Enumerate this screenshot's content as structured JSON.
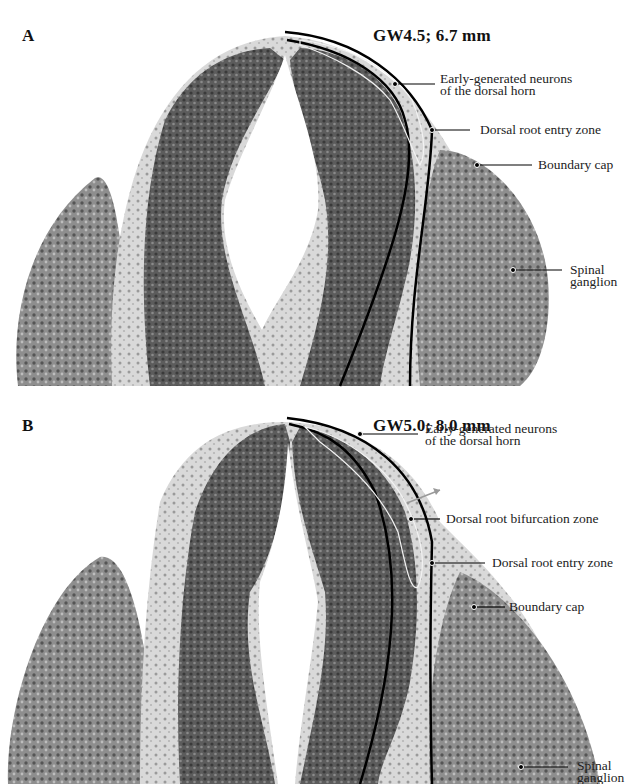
{
  "figure": {
    "panels": [
      {
        "letter": "A",
        "title": "GW4.5; 6.7 mm",
        "labels": {
          "early_neurons_line1": "Early-generated neurons",
          "early_neurons_line2": "of the dorsal horn",
          "entry_zone": "Dorsal root entry zone",
          "boundary_cap": "Boundary cap",
          "ganglion_line1": "Spinal",
          "ganglion_line2": "ganglion"
        }
      },
      {
        "letter": "B",
        "title": "GW5.0; 8.0 mm",
        "labels": {
          "early_neurons_line1": "Early-generated neurons",
          "early_neurons_line2": "of the dorsal horn",
          "bifurcation_zone": "Dorsal root bifurcation zone",
          "entry_zone": "Dorsal root entry zone",
          "boundary_cap": "Boundary cap",
          "ganglion_line1": "Spinal",
          "ganglion_line2": "ganglion"
        }
      }
    ],
    "colors": {
      "tissue_dark": "#4a4a4a",
      "tissue_mid": "#7a7a7a",
      "tissue_light": "#d8d8d8",
      "outline": "#000000",
      "background": "#ffffff"
    }
  }
}
